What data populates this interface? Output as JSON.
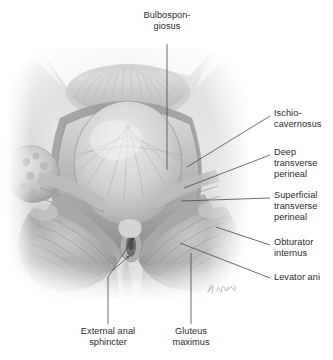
{
  "figure": {
    "style": "grayscale-pencil-illustration",
    "background_color": "#ffffff",
    "signature": "artist-signature"
  },
  "labels": [
    {
      "id": "bulbospongiosus",
      "text": "Bulbospon-\ngiosus",
      "align": "centered",
      "x": 137,
      "y": 10,
      "width": 60,
      "leader": {
        "type": "vertical",
        "from_x": 167,
        "from_y": 44,
        "to_x": 167,
        "to_y": 170
      }
    },
    {
      "id": "ischiocavernosus",
      "text": "Ischio-\ncavernosus",
      "align": "left-aligned",
      "x": 274,
      "y": 108,
      "width": 59,
      "leader": {
        "type": "diagonal",
        "from_x": 270,
        "from_y": 116,
        "to_x": 187,
        "to_y": 167
      }
    },
    {
      "id": "deep-transverse-perineal",
      "text": "Deep\ntransverse\nperineal",
      "align": "left-aligned",
      "x": 274,
      "y": 147,
      "width": 59,
      "leader": {
        "type": "diagonal",
        "from_x": 270,
        "from_y": 155,
        "to_x": 184,
        "to_y": 188
      }
    },
    {
      "id": "superficial-transverse-perineal",
      "text": "Superficial\ntransverse\nperineal",
      "align": "left-aligned",
      "x": 274,
      "y": 190,
      "width": 59,
      "leader": {
        "type": "diagonal",
        "from_x": 270,
        "from_y": 198,
        "to_x": 181,
        "to_y": 201
      }
    },
    {
      "id": "obturator-internus",
      "text": "Obturator\ninternus",
      "align": "left-aligned",
      "x": 274,
      "y": 237,
      "width": 59,
      "leader": {
        "type": "diagonal",
        "from_x": 270,
        "from_y": 245,
        "to_x": 216,
        "to_y": 227
      }
    },
    {
      "id": "levator-ani",
      "text": "Levator ani",
      "align": "left-aligned",
      "x": 274,
      "y": 272,
      "width": 59,
      "leader": {
        "type": "diagonal",
        "from_x": 270,
        "from_y": 278,
        "to_x": 180,
        "to_y": 243
      }
    },
    {
      "id": "external-anal-sphincter",
      "text": "External anal\nsphincter",
      "align": "centered",
      "x": 68,
      "y": 326,
      "width": 80,
      "leader": {
        "type": "forked",
        "from_x": 108,
        "from_y": 324,
        "to_x": 108,
        "to_y": 277,
        "branch_a_x": 133,
        "branch_a_y": 239,
        "branch_b_x": 128,
        "branch_b_y": 257
      }
    },
    {
      "id": "gluteus-maximus",
      "text": "Gluteus\nmaximus",
      "align": "centered",
      "x": 160,
      "y": 326,
      "width": 62,
      "leader": {
        "type": "vertical",
        "from_x": 191,
        "from_y": 324,
        "to_x": 191,
        "to_y": 253
      }
    }
  ],
  "colors": {
    "text": "#2b2b2b",
    "leader_line": "#4a4a4a",
    "illustration_light": "#f2f2f2",
    "illustration_mid": "#b8b8b8",
    "illustration_dark": "#6f6f6f",
    "illustration_shadow": "#4b4b4b"
  }
}
